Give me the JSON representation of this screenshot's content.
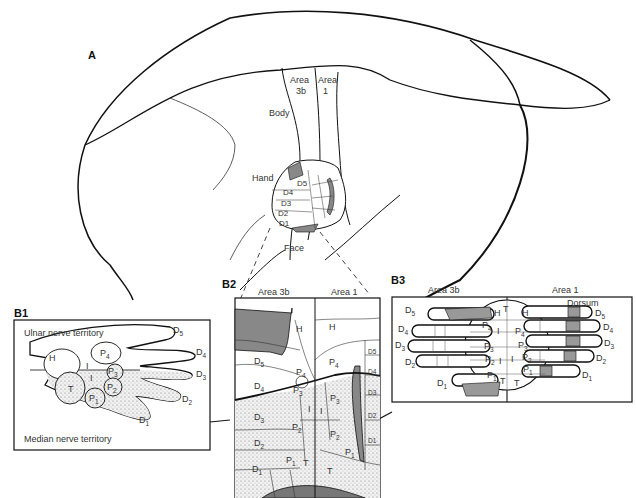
{
  "panels": {
    "A": {
      "label": "A",
      "area_3b": "Area",
      "area_3b_num": "3b",
      "area_1": "Area",
      "area_1_num": "1",
      "body": "Body",
      "hand": "Hand",
      "face": "Face",
      "digits": [
        "D5",
        "D4",
        "D3",
        "D2",
        "D1"
      ]
    },
    "B1": {
      "label": "B1",
      "ulnar": "Ulnar nerve territory",
      "median": "Median nerve territory",
      "pads": {
        "H": "H",
        "I": "I",
        "T": "T",
        "P1": "P",
        "P2": "P",
        "P3": "P",
        "P4": "P"
      },
      "digits": {
        "D1": "D",
        "D2": "D",
        "D3": "D",
        "D4": "D",
        "D5": "D"
      },
      "subs": {
        "s1": "1",
        "s2": "2",
        "s3": "3",
        "s4": "4",
        "s5": "5"
      }
    },
    "B2": {
      "label": "B2",
      "area_3b": "Area 3b",
      "area_1": "Area 1",
      "H": "H",
      "I": "I",
      "T": "T",
      "D": "D",
      "P": "P",
      "subs": {
        "s1": "1",
        "s2": "2",
        "s3": "3",
        "s4": "4",
        "s5": "5"
      }
    },
    "B3": {
      "label": "B3",
      "area_3b": "Area 3b",
      "area_1": "Area 1",
      "dorsum": "Dorsum",
      "H": "H",
      "I": "I",
      "T": "T",
      "D": "D",
      "P": "P",
      "subs": {
        "s1": "1",
        "s2": "2",
        "s3": "3",
        "s4": "4",
        "s5": "5"
      }
    }
  },
  "colors": {
    "stroke": "#111111",
    "shade": "#8a8a8a",
    "stipple": "#e6e6e6"
  }
}
